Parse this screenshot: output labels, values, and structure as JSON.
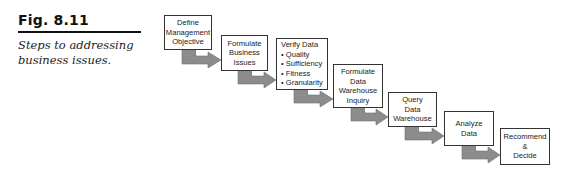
{
  "figure": {
    "label": "Fig. 8.11",
    "caption": "Steps to addressing business issues."
  },
  "colors": {
    "arrow_fill": "#8c8c8c",
    "box_border": "#333333",
    "text": "#222222"
  },
  "steps": [
    {
      "id": 1,
      "text": "Define\nManagement\nObjective"
    },
    {
      "id": 2,
      "text": "Formulate\nBusiness\nIssues"
    },
    {
      "id": 3,
      "text": "Verify Data\n• Quality\n• Sufficiency\n• Fitness\n• Granularity"
    },
    {
      "id": 4,
      "text": "Formulate\nData\nWarehouse\nInquiry"
    },
    {
      "id": 5,
      "text": "Query\nData\nWarehouse"
    },
    {
      "id": 6,
      "text": "Analyze\nData"
    },
    {
      "id": 7,
      "text": "Recommend\n&\nDecide"
    }
  ]
}
